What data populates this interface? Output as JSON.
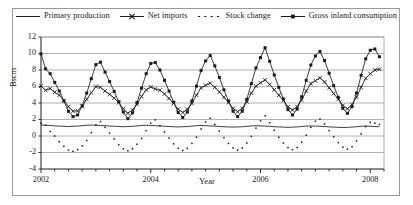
{
  "chart_data": {
    "type": "line",
    "title": "",
    "xlabel": "Year",
    "ylabel": "Bscm",
    "xlim": [
      2002,
      2008.25
    ],
    "ylim": [
      -4,
      12
    ],
    "ytick_values": [
      -4,
      -2,
      0,
      2,
      4,
      6,
      8,
      10,
      12
    ],
    "ytick_labels": [
      "-4",
      "-2",
      "0",
      "2",
      "4",
      "6",
      "8",
      "10",
      "12"
    ],
    "xtick_values": [
      2002,
      2004,
      2006,
      2008
    ],
    "xtick_labels": [
      "2002",
      "2004",
      "2006",
      "2008"
    ],
    "minor_xtick_interval": 0.25,
    "grid": "horizontal",
    "legend_position": "top-center",
    "x": [
      2002.0,
      2002.083,
      2002.167,
      2002.25,
      2002.333,
      2002.417,
      2002.5,
      2002.583,
      2002.667,
      2002.75,
      2002.833,
      2002.917,
      2003.0,
      2003.083,
      2003.167,
      2003.25,
      2003.333,
      2003.417,
      2003.5,
      2003.583,
      2003.667,
      2003.75,
      2003.833,
      2003.917,
      2004.0,
      2004.083,
      2004.167,
      2004.25,
      2004.333,
      2004.417,
      2004.5,
      2004.583,
      2004.667,
      2004.75,
      2004.833,
      2004.917,
      2005.0,
      2005.083,
      2005.167,
      2005.25,
      2005.333,
      2005.417,
      2005.5,
      2005.583,
      2005.667,
      2005.75,
      2005.833,
      2005.917,
      2006.0,
      2006.083,
      2006.167,
      2006.25,
      2006.333,
      2006.417,
      2006.5,
      2006.583,
      2006.667,
      2006.75,
      2006.833,
      2006.917,
      2007.0,
      2007.083,
      2007.167,
      2007.25,
      2007.333,
      2007.417,
      2007.5,
      2007.583,
      2007.667,
      2007.75,
      2007.833,
      2007.917,
      2008.0,
      2008.083,
      2008.167
    ],
    "series": [
      {
        "name": "Primary production",
        "style": "solid-line",
        "marker": "none",
        "color": "#1a1a1a",
        "values": [
          1.35,
          1.3,
          1.28,
          1.22,
          1.2,
          1.18,
          1.15,
          1.18,
          1.2,
          1.25,
          1.3,
          1.32,
          1.3,
          1.28,
          1.25,
          1.2,
          1.18,
          1.15,
          1.12,
          1.15,
          1.18,
          1.22,
          1.28,
          1.3,
          1.28,
          1.25,
          1.22,
          1.18,
          1.15,
          1.12,
          1.1,
          1.12,
          1.15,
          1.2,
          1.25,
          1.28,
          1.25,
          1.22,
          1.2,
          1.15,
          1.12,
          1.1,
          1.08,
          1.1,
          1.12,
          1.18,
          1.22,
          1.25,
          1.22,
          1.2,
          1.18,
          1.12,
          1.1,
          1.08,
          1.05,
          1.08,
          1.1,
          1.15,
          1.2,
          1.22,
          1.2,
          1.18,
          1.15,
          1.1,
          1.08,
          1.05,
          1.02,
          1.05,
          1.08,
          1.12,
          1.18,
          1.2,
          1.18,
          1.15,
          1.12
        ]
      },
      {
        "name": "Net imports",
        "style": "solid-line",
        "marker": "cross",
        "color": "#1a1a1a",
        "values": [
          6.05,
          5.55,
          5.75,
          5.3,
          4.95,
          4.3,
          3.55,
          3.0,
          3.05,
          3.6,
          4.45,
          5.25,
          6.0,
          5.9,
          5.45,
          5.05,
          4.6,
          4.05,
          3.3,
          2.75,
          3.15,
          3.85,
          4.8,
          5.6,
          5.95,
          5.7,
          5.55,
          5.1,
          4.55,
          3.95,
          3.25,
          2.85,
          3.25,
          3.95,
          4.95,
          5.85,
          6.15,
          6.4,
          5.9,
          5.35,
          4.7,
          4.05,
          3.35,
          2.95,
          3.35,
          4.15,
          5.2,
          6.05,
          6.45,
          6.8,
          6.25,
          5.6,
          4.95,
          4.3,
          3.55,
          3.15,
          3.55,
          4.35,
          5.45,
          6.35,
          6.7,
          7.05,
          6.55,
          5.85,
          5.15,
          4.45,
          3.7,
          3.3,
          3.8,
          4.7,
          5.9,
          7.0,
          7.55,
          8.0,
          8.1
        ]
      },
      {
        "name": "Stock change",
        "style": "dotted",
        "marker": "dot",
        "color": "#1a1a1a",
        "values": [
          1.55,
          1.3,
          0.55,
          0.0,
          -0.7,
          -1.25,
          -1.7,
          -1.85,
          -1.65,
          -1.2,
          -0.55,
          0.4,
          1.35,
          1.75,
          1.05,
          0.35,
          -0.35,
          -1.05,
          -1.55,
          -1.8,
          -1.55,
          -1.0,
          -0.3,
          0.65,
          1.55,
          1.95,
          1.25,
          0.5,
          -0.25,
          -0.95,
          -1.5,
          -1.75,
          -1.5,
          -0.9,
          -0.15,
          0.85,
          1.7,
          2.15,
          1.4,
          0.6,
          -0.2,
          -0.9,
          -1.45,
          -1.7,
          -1.45,
          -0.85,
          -0.05,
          0.95,
          1.85,
          2.45,
          1.6,
          0.7,
          -0.15,
          -0.85,
          -1.4,
          -1.65,
          -1.4,
          -0.75,
          0.1,
          1.05,
          1.8,
          2.05,
          1.45,
          0.65,
          -0.1,
          -0.8,
          -1.35,
          -1.6,
          -1.3,
          -0.6,
          0.25,
          1.15,
          1.65,
          1.55,
          1.4
        ]
      },
      {
        "name": "Gross inland consumption",
        "style": "solid-line",
        "marker": "square",
        "color": "#1a1a1a",
        "values": [
          9.95,
          8.15,
          7.55,
          6.5,
          5.45,
          4.25,
          3.0,
          2.35,
          2.55,
          3.65,
          5.2,
          6.95,
          8.65,
          8.95,
          7.75,
          6.6,
          5.4,
          4.15,
          2.9,
          2.1,
          2.8,
          4.05,
          5.8,
          7.55,
          8.8,
          8.9,
          8.0,
          6.75,
          5.45,
          4.1,
          2.85,
          2.25,
          2.9,
          4.25,
          6.05,
          7.95,
          9.1,
          9.75,
          8.5,
          7.1,
          5.6,
          4.25,
          3.0,
          2.35,
          3.0,
          4.45,
          6.35,
          8.25,
          9.5,
          10.7,
          9.05,
          7.4,
          5.9,
          4.5,
          3.2,
          2.55,
          3.25,
          4.75,
          6.75,
          8.6,
          9.7,
          10.25,
          9.15,
          7.6,
          6.1,
          4.7,
          3.35,
          2.75,
          3.55,
          5.2,
          7.35,
          9.35,
          10.4,
          10.55,
          9.6
        ]
      }
    ]
  },
  "legend": {
    "items": [
      {
        "label": "Primary production",
        "key": "solid-line-key"
      },
      {
        "label": "Net imports",
        "key": "cross-marker-line-key"
      },
      {
        "label": "Stock change",
        "key": "dotted-line-key"
      },
      {
        "label": "Gross inland consumption",
        "key": "square-marker-line-key"
      }
    ]
  },
  "axes": {
    "y_title": "Bscm",
    "x_title": "Year"
  }
}
